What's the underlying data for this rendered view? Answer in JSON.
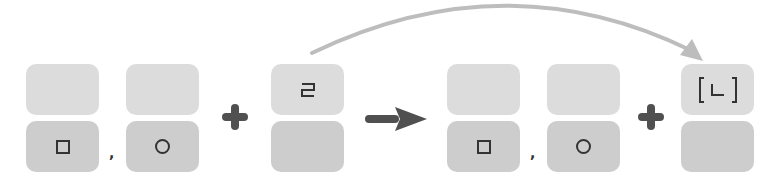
{
  "diagram": {
    "colors": {
      "box_top": "#dcdcdc",
      "box_bottom": "#cdcdcd",
      "operator": "#505050",
      "curve_arrow": "#bdbdbd",
      "glyph": "#333333"
    },
    "left_side": {
      "groups": [
        {
          "top": "",
          "bottom_symbol": "square-icon"
        },
        {
          "top": "",
          "bottom_symbol": "circle-icon"
        }
      ],
      "separator": ",",
      "operator": "+",
      "added": {
        "top": "ㄹ",
        "bottom": ""
      }
    },
    "transform_arrow": "right-arrow-icon",
    "right_side": {
      "groups": [
        {
          "top": "",
          "bottom_symbol": "square-icon"
        },
        {
          "top": "",
          "bottom_symbol": "circle-icon"
        }
      ],
      "separator": ",",
      "operator": "+",
      "result": {
        "top": "[ㄴ]",
        "bottom": ""
      }
    },
    "curve_arrow": "curved-arrow-icon"
  }
}
